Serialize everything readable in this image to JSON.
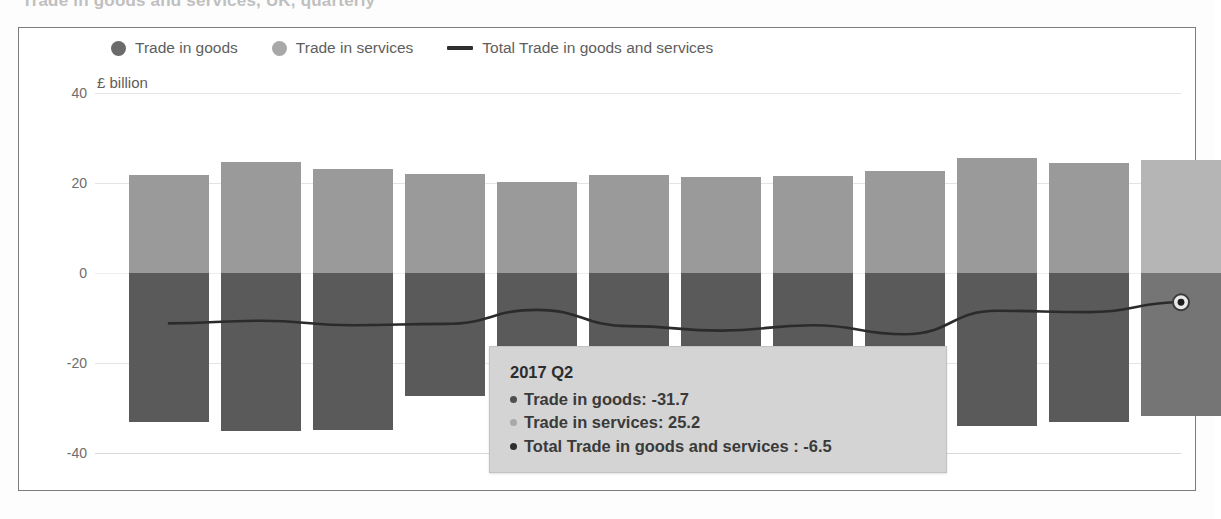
{
  "page": {
    "cut_off_title": "Trade in goods and services, UK, quarterly"
  },
  "legend": {
    "items": [
      {
        "label": "Trade in goods",
        "icon": "circle-marker-icon",
        "color": "#6b6b6b",
        "kind": "circle"
      },
      {
        "label": "Trade in services",
        "icon": "circle-marker-icon",
        "color": "#a8a8a8",
        "kind": "circle"
      },
      {
        "label": "Total Trade in goods and services",
        "icon": "line-marker-icon",
        "color": "#2e2e2e",
        "kind": "line"
      }
    ]
  },
  "axis": {
    "unit_label": "£ billion",
    "y_ticks": [
      "40",
      "20",
      "0",
      "-20",
      "-40"
    ]
  },
  "tooltip": {
    "title": "2017 Q2",
    "rows": [
      {
        "label": "Trade in goods: -31.7",
        "color": "#4f4f4f"
      },
      {
        "label": "Trade in services: 25.2",
        "color": "#a8a8a8"
      },
      {
        "label": "Total Trade in goods and services : -6.5",
        "color": "#2e2e2e"
      }
    ]
  },
  "colors": {
    "goods": "#5a5a5a",
    "services": "#9a9a9a",
    "goods_highlight": "#757575",
    "services_highlight": "#b5b5b5",
    "total_line": "#2b2b2b",
    "grid": "#e4e4e4",
    "panel_border": "#7c7c7c",
    "tooltip_bg": "#d4d4d4"
  },
  "chart_data": {
    "type": "bar",
    "title": "Trade in goods and services, UK, quarterly",
    "subtitle": "",
    "xlabel": "",
    "ylabel": "£ billion",
    "ylim": [
      -40,
      40
    ],
    "yticks": [
      40,
      20,
      0,
      -20,
      -40
    ],
    "grid": true,
    "legend_position": "top",
    "stacked": "diverging",
    "highlighted_category_index": 11,
    "categories": [
      "2014 Q3",
      "2014 Q4",
      "2015 Q1",
      "2015 Q2",
      "2015 Q3",
      "2015 Q4",
      "2016 Q1",
      "2016 Q2",
      "2016 Q3",
      "2016 Q4",
      "2017 Q1",
      "2017 Q2"
    ],
    "series": [
      {
        "name": "Trade in goods",
        "type": "bar",
        "color": "#5a5a5a",
        "values": [
          -33.0,
          -35.2,
          -34.8,
          -27.3,
          -28.4,
          -33.6,
          -34.1,
          -33.2,
          -36.2,
          -34.0,
          -33.1,
          -31.7
        ]
      },
      {
        "name": "Trade in services",
        "type": "bar",
        "color": "#9a9a9a",
        "values": [
          21.8,
          24.6,
          23.2,
          22.0,
          20.2,
          21.8,
          21.3,
          21.6,
          22.6,
          25.6,
          24.4,
          25.2
        ]
      },
      {
        "name": "Total Trade in goods and services",
        "type": "line",
        "color": "#2b2b2b",
        "values": [
          -11.2,
          -10.6,
          -11.6,
          -11.3,
          -8.2,
          -11.8,
          -12.8,
          -11.6,
          -13.6,
          -8.4,
          -8.7,
          -6.5
        ]
      }
    ],
    "annotation": {
      "kind": "hover-tooltip",
      "category": "2017 Q2",
      "values": {
        "Trade in goods": -31.7,
        "Trade in services": 25.2,
        "Total Trade in goods and services": -6.5
      }
    }
  },
  "geometry": {
    "zero_y": 272,
    "px_per_unit": 4.5,
    "bar_x": [
      110,
      202,
      294,
      386,
      478,
      570,
      662,
      754,
      846,
      938,
      1030,
      1122
    ],
    "bar_width": 80,
    "gridline_y": [
      92,
      182,
      272,
      362,
      452
    ]
  }
}
